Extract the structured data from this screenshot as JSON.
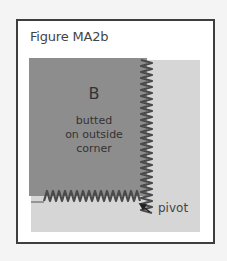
{
  "figure": {
    "title": "Figure MA2b",
    "patch_label": "B",
    "patch_description": [
      "butted",
      "on outside",
      "corner"
    ],
    "pivot_label": "pivot",
    "colors": {
      "frame_border": "#3e3e3e",
      "dark_patch": "#8d8d8d",
      "light_patch": "#d6d6d6",
      "stitch": "#4a4a4a"
    }
  }
}
